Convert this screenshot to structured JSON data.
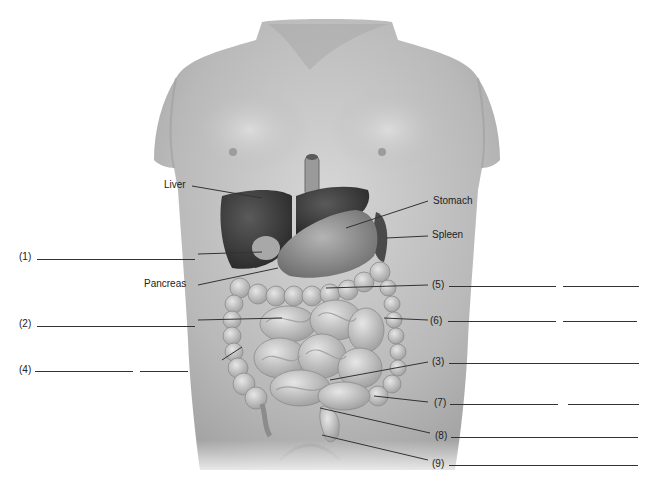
{
  "diagram": {
    "named_labels": [
      {
        "id": "liver",
        "text": "Liver"
      },
      {
        "id": "stomach",
        "text": "Stomach"
      },
      {
        "id": "spleen",
        "text": "Spleen"
      },
      {
        "id": "pancreas",
        "text": "Pancreas"
      }
    ],
    "numbered_labels": [
      {
        "id": "n1",
        "text": "(1)",
        "blanks": 1
      },
      {
        "id": "n2",
        "text": "(2)",
        "blanks": 1
      },
      {
        "id": "n3",
        "text": "(3)",
        "blanks": 1
      },
      {
        "id": "n4",
        "text": "(4)",
        "blanks": 2
      },
      {
        "id": "n5",
        "text": "(5)",
        "blanks": 2
      },
      {
        "id": "n6",
        "text": "(6)",
        "blanks": 2
      },
      {
        "id": "n7",
        "text": "(7)",
        "blanks": 2
      },
      {
        "id": "n8",
        "text": "(8)",
        "blanks": 1
      },
      {
        "id": "n9",
        "text": "(9)",
        "blanks": 1
      }
    ],
    "colors": {
      "skin": "#b8b8b8",
      "skin_highlight": "#d4d4d4",
      "liver": "#3c3c3c",
      "stomach": "#8e8e8e",
      "intestine": "#c8c8c8",
      "line": "#333333",
      "text": "#222222"
    }
  }
}
